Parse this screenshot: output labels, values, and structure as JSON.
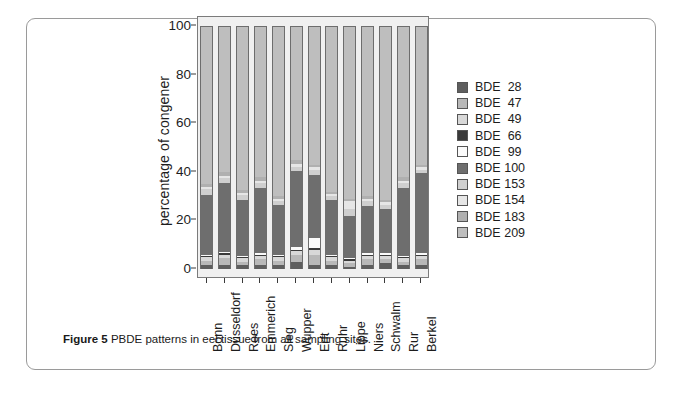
{
  "figure": {
    "caption_label": "Figure 5",
    "caption_text": " PBDE patterns in eel tissue from all sampling sites."
  },
  "chart_data": {
    "type": "bar",
    "stacked": true,
    "normalized": true,
    "title": "",
    "subtitle": "",
    "xlabel": "",
    "ylabel": "percentage of congener",
    "ylim": [
      0,
      100
    ],
    "yticks": [
      0,
      20,
      40,
      60,
      80,
      100
    ],
    "ytick_labels": [
      "0",
      "20",
      "40",
      "60",
      "80",
      "100"
    ],
    "grid": false,
    "legend_position": "right",
    "categories": [
      "Bonn",
      "Düsseldorf",
      "Rees",
      "Emmerich",
      "Sieg",
      "Wupper",
      "Erft",
      "Ruhr",
      "Lippe",
      "Niers",
      "Schwalm",
      "Rur",
      "Berkel"
    ],
    "series": [
      {
        "name": "BDE  28",
        "color": "#5e5e5e",
        "values": [
          1.5,
          1.5,
          1.5,
          1.5,
          1.5,
          2.8,
          1.5,
          1.5,
          1.0,
          1.5,
          2.5,
          1.5,
          1.5
        ]
      },
      {
        "name": "BDE  47",
        "color": "#b8b8b8",
        "values": [
          2.0,
          3.0,
          1.5,
          2.5,
          2.0,
          3.0,
          4.5,
          2.0,
          1.5,
          2.5,
          1.5,
          1.5,
          2.5
        ]
      },
      {
        "name": "BDE  49",
        "color": "#d8d8d8",
        "values": [
          1.5,
          1.5,
          1.5,
          1.5,
          1.5,
          1.5,
          2.0,
          1.5,
          1.0,
          1.5,
          1.5,
          1.5,
          1.5
        ]
      },
      {
        "name": "BDE  66",
        "color": "#3a3a3a",
        "values": [
          0.5,
          0.5,
          0.5,
          0.5,
          0.5,
          0.7,
          0.5,
          0.5,
          0.5,
          0.5,
          0.5,
          0.5,
          0.5
        ]
      },
      {
        "name": "BDE  99",
        "color": "#fbfbfb",
        "values": [
          0.5,
          0.5,
          0.5,
          0.5,
          0.5,
          1.0,
          4.5,
          0.5,
          0.5,
          0.5,
          0.5,
          0.5,
          0.5
        ]
      },
      {
        "name": "BDE 100",
        "color": "#6e6e6e",
        "values": [
          24.5,
          28.5,
          23.0,
          27.0,
          20.5,
          31.5,
          26.0,
          22.5,
          17.5,
          19.5,
          18.5,
          28.0,
          33.0
        ]
      },
      {
        "name": "BDE 153",
        "color": "#cfcfcf",
        "values": [
          2.5,
          2.0,
          2.0,
          2.0,
          1.5,
          1.5,
          2.0,
          1.5,
          3.0,
          2.0,
          1.5,
          2.0,
          1.5
        ]
      },
      {
        "name": "BDE 154",
        "color": "#e6e6e6",
        "values": [
          1.0,
          1.0,
          1.0,
          1.0,
          1.0,
          1.5,
          1.0,
          1.0,
          3.0,
          1.0,
          1.0,
          1.0,
          1.0
        ]
      },
      {
        "name": "BDE 183",
        "color": "#b0b0b0",
        "values": [
          1.0,
          1.5,
          1.0,
          1.5,
          1.0,
          1.5,
          1.0,
          1.0,
          1.0,
          1.0,
          1.0,
          1.5,
          1.0
        ]
      },
      {
        "name": "BDE 209",
        "color": "#bebebe",
        "values": [
          65.0,
          60.0,
          67.5,
          62.0,
          70.0,
          55.0,
          57.0,
          68.0,
          71.0,
          70.0,
          71.5,
          62.0,
          57.0
        ]
      }
    ]
  }
}
